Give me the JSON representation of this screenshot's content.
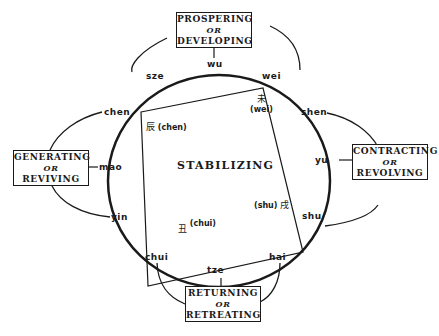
{
  "phases": {
    "top": {
      "line1": "Prospering",
      "or": "or",
      "line2": "Developing"
    },
    "left": {
      "line1": "Generating",
      "or": "or",
      "line2": "Reviving"
    },
    "right": {
      "line1": "Contracting",
      "or": "or",
      "line2": "Revolving"
    },
    "bottom": {
      "line1": "Returning",
      "or": "or",
      "line2": "Retreating"
    }
  },
  "center": {
    "title": "Stabilizing"
  },
  "branches": {
    "wu": "wu",
    "sze": "sze",
    "wei": "wei",
    "chen": "chen",
    "mao": "mao",
    "yin": "yin",
    "shen": "shen",
    "yu": "yu",
    "shu": "shu",
    "chui": "chui",
    "tze": "tze",
    "hai": "hai"
  },
  "corners": {
    "wei": {
      "glyph": "未",
      "label": "(wei)"
    },
    "chen": {
      "glyph": "辰",
      "label": "(chen)"
    },
    "shu": {
      "glyph": "戌",
      "label": "(shu)"
    },
    "chui": {
      "glyph": "丑",
      "label": "(chui)"
    }
  }
}
